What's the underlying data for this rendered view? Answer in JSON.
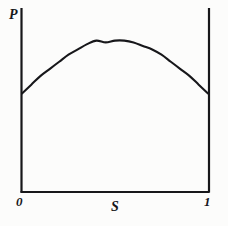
{
  "figure": {
    "axis_labels": {
      "y": "P",
      "x": "S"
    },
    "x_ticks": {
      "left": "0",
      "right": "1"
    },
    "colors": {
      "ink": "#17171a",
      "background": "#fcfcfb"
    }
  },
  "chart_data": {
    "type": "line",
    "title": "",
    "xlabel": "S",
    "ylabel": "P",
    "xlim": [
      0,
      1
    ],
    "ylim": [
      0,
      1
    ],
    "grid": false,
    "legend": null,
    "xtick_labels": [
      "0",
      "1"
    ],
    "xtick_values": [
      0,
      1
    ],
    "ytick_labels": [],
    "ytick_values": [],
    "annotations": [],
    "series": [
      {
        "name": "P(S)",
        "x": [
          0.0,
          0.05,
          0.1,
          0.15,
          0.2,
          0.25,
          0.3,
          0.35,
          0.4,
          0.45,
          0.5,
          0.55,
          0.6,
          0.65,
          0.7,
          0.75,
          0.8,
          0.85,
          0.9,
          0.95,
          1.0
        ],
        "y": [
          0.56,
          0.61,
          0.66,
          0.7,
          0.74,
          0.78,
          0.81,
          0.84,
          0.86,
          0.85,
          0.86,
          0.86,
          0.85,
          0.83,
          0.81,
          0.78,
          0.74,
          0.7,
          0.66,
          0.61,
          0.56
        ]
      }
    ]
  }
}
